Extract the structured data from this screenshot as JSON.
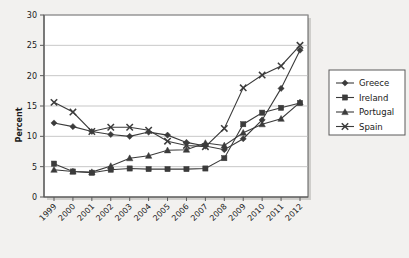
{
  "chart_data": {
    "type": "line",
    "title": "",
    "xlabel": "",
    "ylabel": "Percent",
    "categories": [
      "1999",
      "2000",
      "2001",
      "2002",
      "2003",
      "2004",
      "2005",
      "2006",
      "2007",
      "2008",
      "2009",
      "2010",
      "2011",
      "2012"
    ],
    "xlim": [
      1999,
      2012
    ],
    "ylim": [
      0,
      30
    ],
    "yticks": [
      0,
      5,
      10,
      15,
      20,
      25,
      30
    ],
    "grid": "horizontal",
    "legend_position": "right",
    "series": [
      {
        "name": "Greece",
        "marker": "diamond",
        "color": "#3b3b3b",
        "values": [
          12.2,
          11.6,
          10.8,
          10.3,
          10.0,
          10.7,
          10.2,
          9.0,
          8.4,
          7.8,
          9.6,
          12.7,
          17.9,
          24.2
        ]
      },
      {
        "name": "Ireland",
        "marker": "square",
        "color": "#3b3b3b",
        "values": [
          5.5,
          4.2,
          4.0,
          4.5,
          4.7,
          4.6,
          4.6,
          4.6,
          4.7,
          6.4,
          12.0,
          13.9,
          14.7,
          15.5
        ]
      },
      {
        "name": "Portugal",
        "marker": "triangle",
        "color": "#3b3b3b",
        "values": [
          4.5,
          4.2,
          4.1,
          5.1,
          6.4,
          6.8,
          7.7,
          7.8,
          8.9,
          8.5,
          10.6,
          12.0,
          12.9,
          15.6
        ]
      },
      {
        "name": "Spain",
        "marker": "cross",
        "color": "#3b3b3b",
        "values": [
          15.6,
          14.0,
          10.8,
          11.5,
          11.5,
          11.0,
          9.2,
          8.5,
          8.3,
          11.3,
          18.0,
          20.1,
          21.6,
          25.0
        ]
      }
    ]
  },
  "legend": {
    "items": [
      {
        "label": "Greece"
      },
      {
        "label": "Ireland"
      },
      {
        "label": "Portugal"
      },
      {
        "label": "Spain"
      }
    ]
  }
}
